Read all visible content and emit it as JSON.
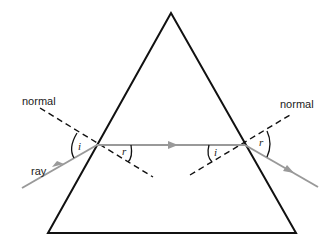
{
  "diagram": {
    "labels": {
      "normal_left": "normal",
      "normal_right": "normal",
      "ray": "ray",
      "angle_i_entry": "i",
      "angle_r_entry": "r",
      "angle_i_exit": "i",
      "angle_r_exit": "r"
    },
    "colors": {
      "prism": "#111111",
      "ray": "#999999",
      "normal": "#111111"
    }
  }
}
